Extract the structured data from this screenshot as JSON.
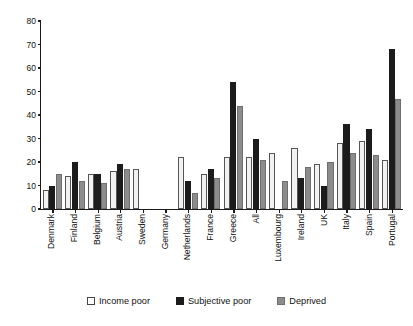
{
  "chart_data": {
    "type": "bar",
    "title": "",
    "xlabel": "",
    "ylabel": "",
    "ylim": [
      0,
      80
    ],
    "yticks": [
      0,
      10,
      20,
      30,
      40,
      50,
      60,
      70,
      80
    ],
    "grid": false,
    "legend_position": "bottom",
    "categories": [
      "Denmark",
      "Finland",
      "Belgium",
      "Austria",
      "Sweden",
      "Germany",
      "Netherlands",
      "France",
      "Greece",
      "All",
      "Luxembourg",
      "Ireland",
      "UK",
      "Italy",
      "Spain",
      "Portugal"
    ],
    "series": [
      {
        "name": "Income poor",
        "color": "#f2f2f2",
        "values": [
          8,
          14,
          15,
          16,
          17,
          null,
          22,
          15,
          22,
          22,
          24,
          26,
          19,
          28,
          29,
          21
        ]
      },
      {
        "name": "Subjective poor",
        "color": "#1c1c1c",
        "values": [
          10,
          20,
          15,
          19,
          null,
          null,
          12,
          17,
          54,
          30,
          null,
          13,
          10,
          36,
          34,
          68
        ]
      },
      {
        "name": "Deprived",
        "color": "#8c8c8c",
        "values": [
          15,
          12,
          11,
          17,
          null,
          null,
          7,
          13,
          44,
          21,
          12,
          18,
          20,
          24,
          23,
          47
        ]
      }
    ]
  },
  "legend": {
    "items": [
      {
        "label": "Income poor",
        "swatch": "income"
      },
      {
        "label": "Subjective poor",
        "swatch": "subjective"
      },
      {
        "label": "Deprived",
        "swatch": "deprived"
      }
    ]
  },
  "axis": {
    "y_labels": [
      "80",
      "70",
      "60",
      "50",
      "40",
      "30",
      "20",
      "10",
      "0"
    ]
  }
}
